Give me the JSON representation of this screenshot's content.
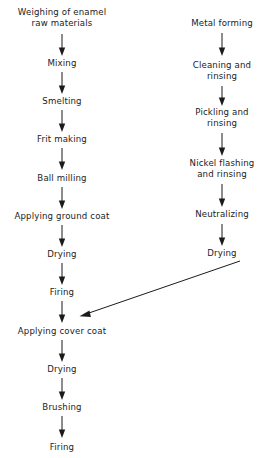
{
  "diagram": {
    "background_color": "#ffffff",
    "line_color": "#1b1b1b",
    "text_color": "#1b1b1b",
    "columns": [
      {
        "id": "enamel-column",
        "name": "Enamel raw material line",
        "steps": [
          {
            "id": "weighing",
            "label_line1": "Weighing of enamel",
            "label_line2": "raw materials"
          },
          {
            "id": "mixing",
            "label_line1": "Mixing",
            "label_line2": ""
          },
          {
            "id": "smelting",
            "label_line1": "Smelting",
            "label_line2": ""
          },
          {
            "id": "frit-making",
            "label_line1": "Frit making",
            "label_line2": ""
          },
          {
            "id": "ball-milling",
            "label_line1": "Ball milling",
            "label_line2": ""
          },
          {
            "id": "applying-ground-coat",
            "label_line1": "Applying ground coat",
            "label_line2": ""
          },
          {
            "id": "drying-ground",
            "label_line1": "Drying",
            "label_line2": ""
          },
          {
            "id": "firing-ground",
            "label_line1": "Firing",
            "label_line2": ""
          },
          {
            "id": "applying-cover-coat",
            "label_line1": "Applying cover coat",
            "label_line2": ""
          },
          {
            "id": "drying-cover",
            "label_line1": "Drying",
            "label_line2": ""
          },
          {
            "id": "brushing",
            "label_line1": "Brushing",
            "label_line2": ""
          },
          {
            "id": "firing-cover",
            "label_line1": "Firing",
            "label_line2": ""
          }
        ]
      },
      {
        "id": "metal-column",
        "name": "Metal substrate preparation line",
        "steps": [
          {
            "id": "metal-forming",
            "label_line1": "Metal forming",
            "label_line2": ""
          },
          {
            "id": "cleaning-rinsing",
            "label_line1": "Cleaning and",
            "label_line2": "rinsing"
          },
          {
            "id": "pickling-rinsing",
            "label_line1": "Pickling and",
            "label_line2": "rinsing"
          },
          {
            "id": "nickel-flashing",
            "label_line1": "Nickel flashing",
            "label_line2": "and rinsing"
          },
          {
            "id": "neutralizing",
            "label_line1": "Neutralizing",
            "label_line2": ""
          },
          {
            "id": "drying-metal",
            "label_line1": "Drying",
            "label_line2": ""
          }
        ]
      }
    ],
    "connector": {
      "id": "metal-to-cover-coat",
      "name": "Diagonal connector from metal drying to applying cover coat"
    }
  }
}
